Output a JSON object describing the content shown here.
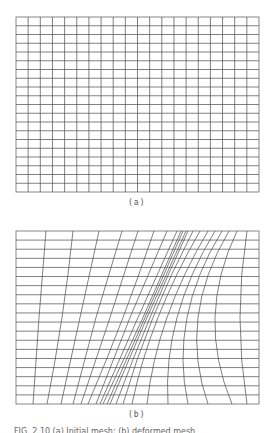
{
  "figure": {
    "panel_a": {
      "label": "(a)",
      "description": "Uniform rectangular mesh",
      "box": {
        "x": 16,
        "y": 17,
        "w": 243,
        "h": 175
      },
      "columns": 20,
      "rows": 20
    },
    "panel_b": {
      "label": "(b)",
      "description": "Mesh deformed into an S-shaped band of concentrated vertical lines",
      "box": {
        "x": 16,
        "y": 231,
        "w": 243,
        "h": 173
      },
      "rows": 19,
      "vertical_lines": {
        "top": [
          46,
          73,
          99,
          122,
          138,
          154,
          167,
          177,
          181,
          183,
          186,
          188,
          193,
          200,
          208,
          215,
          222,
          229,
          237,
          247
        ],
        "middle": [
          39,
          62,
          80,
          96,
          110,
          123,
          130,
          138,
          143,
          145,
          147,
          150,
          153,
          158,
          167,
          177,
          187,
          198,
          215,
          240
        ],
        "bottom": [
          33,
          47,
          61,
          73,
          81,
          88,
          96,
          100,
          103,
          107,
          110,
          116,
          123,
          132,
          147,
          168,
          188,
          208,
          232,
          247
        ]
      }
    },
    "caption": "FIG. 2.10 (a) Initial mesh; (b) deformed mesh"
  },
  "style": {
    "line_color": "#4a4a4a",
    "border_color": "#6a6a6a",
    "background": "#ffffff"
  }
}
